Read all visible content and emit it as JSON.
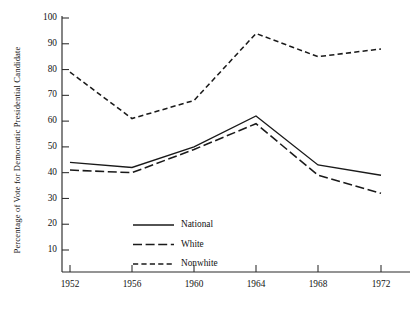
{
  "chart_data": {
    "type": "line",
    "title": "",
    "xlabel": "",
    "ylabel": "Percentage of Vote for Democratic Presidential Candidate",
    "categories": [
      "1952",
      "1956",
      "1960",
      "1964",
      "1968",
      "1972"
    ],
    "x": [
      1952,
      1956,
      1960,
      1964,
      1968,
      1972
    ],
    "ylim": [
      0,
      100
    ],
    "xlim": [
      1950,
      1974
    ],
    "yticks": [
      10,
      20,
      30,
      40,
      50,
      60,
      70,
      80,
      90,
      100
    ],
    "ytick_labels": [
      "10",
      "20",
      "30",
      "40",
      "50",
      "60",
      "70",
      "80",
      "90",
      "100"
    ],
    "xtick_labels": [
      "1952",
      "1956",
      "1960",
      "1964",
      "1968",
      "1972"
    ],
    "grid": false,
    "legend_position": "lower-center-left",
    "series": [
      {
        "name": "National",
        "style": "solid",
        "color": "#1a1a1a",
        "values": [
          44,
          42,
          50,
          62,
          43,
          39
        ]
      },
      {
        "name": "White",
        "style": "long-dash",
        "color": "#1a1a1a",
        "values": [
          41,
          40,
          49,
          59,
          39,
          32
        ]
      },
      {
        "name": "Nonwhite",
        "style": "short-dash",
        "color": "#1a1a1a",
        "values": [
          79,
          61,
          68,
          94,
          85,
          88
        ]
      }
    ]
  },
  "legend": {
    "entries": [
      {
        "label": "National"
      },
      {
        "label": "White"
      },
      {
        "label": "Nonwhite"
      }
    ]
  },
  "axes": {
    "y_axis_title": "Percentage of Vote for Democratic Presidential Candidate"
  }
}
